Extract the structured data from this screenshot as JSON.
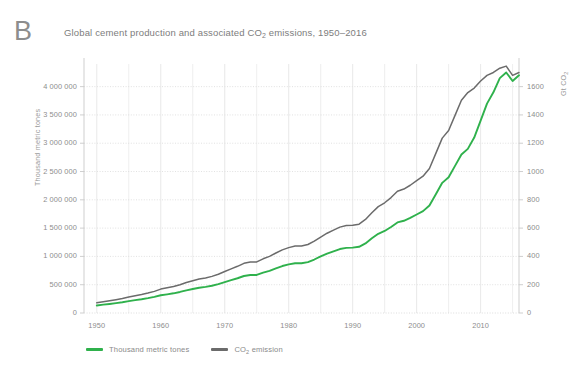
{
  "panel": {
    "label": "B"
  },
  "header": {
    "title_prefix": "Global cement production and associated CO",
    "title_sub": "2",
    "title_suffix": " emissions, 1950–2016"
  },
  "axes": {
    "left_title": "Thousand metric tones",
    "right_title_prefix": "Gt CO",
    "right_title_sub": "2"
  },
  "legend": {
    "items": [
      {
        "label": "Thousand metric tones",
        "sub": "",
        "suffix": "",
        "color": "#2fb14c"
      },
      {
        "label": "CO",
        "sub": "2",
        "suffix": " emission",
        "color": "#6b6b6b"
      }
    ]
  },
  "colors": {
    "cement": "#2fb14c",
    "co2": "#6b6b6b",
    "grid": "#e2e2e2",
    "grid_dotted": "#d9d9d9",
    "axis": "#c9c9c9",
    "text": "#8d8d8d",
    "background": "#ffffff"
  },
  "chart_data": {
    "type": "line",
    "title": "Global cement production and associated CO2 emissions, 1950–2016",
    "xlabel": "",
    "ylabel": "Thousand metric tones",
    "y2label": "Gt CO2",
    "xlim": [
      1948,
      2016
    ],
    "ylim": [
      0,
      4400000
    ],
    "y2lim": [
      0,
      1760
    ],
    "yticks": [
      0,
      500000,
      1000000,
      1500000,
      2000000,
      2500000,
      3000000,
      3500000,
      4000000
    ],
    "ytick_labels": [
      "0",
      "500 000",
      "1 000 000",
      "1 500 000",
      "2 000 000",
      "2 500 000",
      "3 000 000",
      "3 500 000",
      "4 000 000"
    ],
    "y2ticks": [
      0,
      200,
      400,
      600,
      800,
      1000,
      1200,
      1400,
      1600
    ],
    "y2tick_labels": [
      "0",
      "200",
      "400",
      "600",
      "800",
      "1000",
      "1200",
      "1400",
      "1600"
    ],
    "xticks": [
      1950,
      1960,
      1970,
      1980,
      1990,
      2000,
      2010
    ],
    "xtick_labels": [
      "1950",
      "1960",
      "1970",
      "1980",
      "1990",
      "2000",
      "2010"
    ],
    "x_minor_step": 5,
    "grid": true,
    "legend_position": "bottom-left",
    "x": [
      1950,
      1951,
      1952,
      1953,
      1954,
      1955,
      1956,
      1957,
      1958,
      1959,
      1960,
      1961,
      1962,
      1963,
      1964,
      1965,
      1966,
      1967,
      1968,
      1969,
      1970,
      1971,
      1972,
      1973,
      1974,
      1975,
      1976,
      1977,
      1978,
      1979,
      1980,
      1981,
      1982,
      1983,
      1984,
      1985,
      1986,
      1987,
      1988,
      1989,
      1990,
      1991,
      1992,
      1993,
      1994,
      1995,
      1996,
      1997,
      1998,
      1999,
      2000,
      2001,
      2002,
      2003,
      2004,
      2005,
      2006,
      2007,
      2008,
      2009,
      2010,
      2011,
      2012,
      2013,
      2014,
      2015,
      2016
    ],
    "series": [
      {
        "name": "Thousand metric tones",
        "color": "#2fb14c",
        "axis": "left",
        "unit": "thousand metric tones",
        "values": [
          133000,
          147000,
          160000,
          175000,
          190000,
          210000,
          228000,
          243000,
          262000,
          285000,
          314000,
          330000,
          348000,
          372000,
          400000,
          425000,
          447000,
          462000,
          482000,
          510000,
          545000,
          580000,
          614000,
          654000,
          672000,
          672000,
          712000,
          745000,
          790000,
          830000,
          860000,
          880000,
          880000,
          900000,
          945000,
          1000000,
          1050000,
          1090000,
          1130000,
          1150000,
          1155000,
          1170000,
          1230000,
          1320000,
          1400000,
          1450000,
          1520000,
          1600000,
          1630000,
          1680000,
          1740000,
          1800000,
          1900000,
          2100000,
          2300000,
          2400000,
          2600000,
          2800000,
          2900000,
          3100000,
          3400000,
          3700000,
          3900000,
          4150000,
          4250000,
          4100000,
          4200000
        ]
      },
      {
        "name": "CO2 emission",
        "color": "#6b6b6b",
        "axis": "right",
        "unit": "Gt CO2",
        "values": [
          72,
          79,
          86,
          94,
          102,
          113,
          122,
          131,
          141,
          153,
          169,
          178,
          187,
          200,
          215,
          228,
          240,
          248,
          259,
          274,
          293,
          312,
          330,
          351,
          361,
          361,
          383,
          400,
          424,
          446,
          462,
          473,
          473,
          484,
          508,
          537,
          564,
          586,
          607,
          618,
          620,
          628,
          661,
          709,
          752,
          779,
          816,
          860,
          876,
          903,
          935,
          967,
          1021,
          1128,
          1236,
          1290,
          1397,
          1504,
          1558,
          1590,
          1640,
          1680,
          1700,
          1730,
          1745,
          1680,
          1700
        ]
      }
    ]
  },
  "plot_geometry": {
    "left": 84,
    "right": 519,
    "top": 64,
    "bottom": 313
  }
}
